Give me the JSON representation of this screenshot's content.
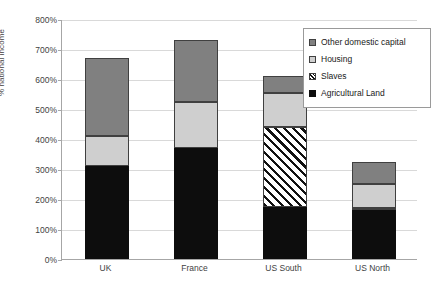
{
  "chart_data": {
    "type": "bar",
    "subtype": "stacked-bar",
    "title": "",
    "xlabel": "",
    "ylabel": "% national income",
    "ylim": [
      0,
      800
    ],
    "ytick_step": 100,
    "ytick_labels": [
      "800%",
      "700%",
      "600%",
      "500%",
      "400%",
      "300%",
      "200%",
      "100%",
      "0%"
    ],
    "ytick_values": [
      800,
      700,
      600,
      500,
      400,
      300,
      200,
      100,
      0
    ],
    "grid": true,
    "legend_position": "top-right",
    "categories": [
      "UK",
      "France",
      "US South",
      "US North"
    ],
    "series": [
      {
        "name": "Agricultural Land",
        "color": "#0d0d0d",
        "pattern": "solid",
        "values": [
          310,
          370,
          175,
          165
        ]
      },
      {
        "name": "Slaves",
        "color": "#111111",
        "pattern": "diagonal-hatch",
        "values": [
          0,
          0,
          265,
          5
        ]
      },
      {
        "name": "Housing",
        "color": "#cfcfcf",
        "pattern": "solid",
        "values": [
          100,
          153,
          115,
          80
        ]
      },
      {
        "name": "Other domestic capital",
        "color": "#808080",
        "pattern": "solid",
        "values": [
          260,
          207,
          55,
          75
        ]
      }
    ],
    "stack_order": [
      "Agricultural Land",
      "Slaves",
      "Housing",
      "Other domestic capital"
    ],
    "totals": [
      670,
      730,
      610,
      325
    ]
  },
  "legend": {
    "items": [
      {
        "label": "Other domestic capital",
        "key": "other"
      },
      {
        "label": "Housing",
        "key": "house"
      },
      {
        "label": "Slaves",
        "key": "slaves"
      },
      {
        "label": "Agricultural Land",
        "key": "agri"
      }
    ]
  },
  "axes": {
    "y_title": "% national income"
  }
}
